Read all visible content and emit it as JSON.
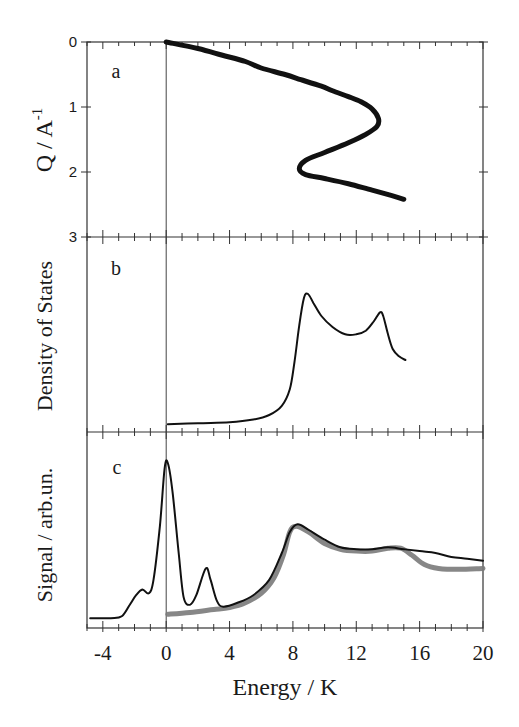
{
  "chart_data": [
    {
      "panel": "a",
      "type": "line",
      "panel_label": "a",
      "xlabel": "Energy / K",
      "ylabel": "Q / A^-1",
      "ylabel_main": "Q / A",
      "ylabel_sup": "-1",
      "xlim": [
        -5,
        20
      ],
      "ylim": [
        3,
        0
      ],
      "y_inverted": true,
      "yticks": [
        "0",
        "1",
        "2",
        "3"
      ],
      "grid": false,
      "series": [
        {
          "name": "dispersion",
          "color": "#111111",
          "points": [
            [
              0,
              0
            ],
            [
              2,
              0.1
            ],
            [
              3.5,
              0.2
            ],
            [
              5,
              0.3
            ],
            [
              6,
              0.4
            ],
            [
              7.5,
              0.5
            ],
            [
              8.5,
              0.58
            ],
            [
              9.8,
              0.68
            ],
            [
              10.5,
              0.75
            ],
            [
              11.5,
              0.84
            ],
            [
              12.3,
              0.92
            ],
            [
              13,
              1.03
            ],
            [
              13.4,
              1.18
            ],
            [
              13.3,
              1.3
            ],
            [
              12.6,
              1.42
            ],
            [
              11.5,
              1.55
            ],
            [
              10,
              1.7
            ],
            [
              8.8,
              1.82
            ],
            [
              8.4,
              1.95
            ],
            [
              8.8,
              2.04
            ],
            [
              10,
              2.1
            ],
            [
              11.5,
              2.18
            ],
            [
              13,
              2.28
            ],
            [
              14.2,
              2.36
            ],
            [
              15,
              2.42
            ]
          ]
        }
      ]
    },
    {
      "panel": "b",
      "type": "line",
      "panel_label": "b",
      "xlabel": "Energy / K",
      "ylabel": "Density of States",
      "xlim": [
        -5,
        20
      ],
      "ylim": [
        0,
        1
      ],
      "grid": false,
      "series": [
        {
          "name": "density of states",
          "color": "#111111",
          "points": [
            [
              0.1,
              0.01
            ],
            [
              2,
              0.015
            ],
            [
              4,
              0.02
            ],
            [
              5.5,
              0.035
            ],
            [
              6.5,
              0.06
            ],
            [
              7.3,
              0.11
            ],
            [
              7.8,
              0.2
            ],
            [
              8.1,
              0.35
            ],
            [
              8.4,
              0.55
            ],
            [
              8.7,
              0.7
            ],
            [
              8.95,
              0.72
            ],
            [
              9.3,
              0.67
            ],
            [
              9.8,
              0.6
            ],
            [
              10.5,
              0.54
            ],
            [
              11.3,
              0.5
            ],
            [
              12,
              0.5
            ],
            [
              12.6,
              0.52
            ],
            [
              13.1,
              0.57
            ],
            [
              13.5,
              0.62
            ],
            [
              13.7,
              0.6
            ],
            [
              14,
              0.5
            ],
            [
              14.3,
              0.42
            ],
            [
              14.7,
              0.38
            ],
            [
              15.1,
              0.36
            ]
          ]
        }
      ]
    },
    {
      "panel": "c",
      "type": "line",
      "panel_label": "c",
      "xlabel": "Energy / K",
      "ylabel": "Signal / arb.un.",
      "xlim": [
        -5,
        20
      ],
      "ylim": [
        0,
        1
      ],
      "xticks": [
        "-4",
        "0",
        "4",
        "8",
        "12",
        "16",
        "20"
      ],
      "grid": false,
      "series": [
        {
          "name": "measured signal",
          "color": "#111111",
          "points": [
            [
              -4.8,
              0.02
            ],
            [
              -3.5,
              0.02
            ],
            [
              -2.8,
              0.03
            ],
            [
              -2.3,
              0.09
            ],
            [
              -1.9,
              0.14
            ],
            [
              -1.5,
              0.17
            ],
            [
              -1.1,
              0.15
            ],
            [
              -0.8,
              0.22
            ],
            [
              -0.4,
              0.5
            ],
            [
              -0.1,
              0.8
            ],
            [
              0.1,
              0.83
            ],
            [
              0.4,
              0.68
            ],
            [
              0.8,
              0.35
            ],
            [
              1.1,
              0.13
            ],
            [
              1.5,
              0.09
            ],
            [
              1.9,
              0.14
            ],
            [
              2.5,
              0.28
            ],
            [
              2.8,
              0.22
            ],
            [
              3.2,
              0.11
            ],
            [
              3.6,
              0.08
            ],
            [
              4.5,
              0.1
            ],
            [
              5.5,
              0.14
            ],
            [
              6.5,
              0.22
            ],
            [
              7.3,
              0.36
            ],
            [
              7.8,
              0.47
            ],
            [
              8.3,
              0.51
            ],
            [
              9,
              0.48
            ],
            [
              10,
              0.43
            ],
            [
              11,
              0.39
            ],
            [
              12,
              0.38
            ],
            [
              13,
              0.38
            ],
            [
              14,
              0.39
            ],
            [
              15,
              0.38
            ],
            [
              16,
              0.37
            ],
            [
              17,
              0.36
            ],
            [
              18,
              0.34
            ],
            [
              19,
              0.33
            ],
            [
              20,
              0.32
            ]
          ]
        },
        {
          "name": "calculated",
          "color": "#7a7a7a",
          "points": [
            [
              0.1,
              0.04
            ],
            [
              1.5,
              0.05
            ],
            [
              3,
              0.065
            ],
            [
              4,
              0.075
            ],
            [
              5,
              0.1
            ],
            [
              6,
              0.15
            ],
            [
              6.8,
              0.23
            ],
            [
              7.4,
              0.35
            ],
            [
              7.8,
              0.47
            ],
            [
              8.2,
              0.5
            ],
            [
              9,
              0.47
            ],
            [
              10,
              0.41
            ],
            [
              11,
              0.38
            ],
            [
              12,
              0.37
            ],
            [
              13,
              0.37
            ],
            [
              14,
              0.385
            ],
            [
              14.8,
              0.385
            ],
            [
              15.5,
              0.35
            ],
            [
              16.3,
              0.3
            ],
            [
              17.2,
              0.28
            ],
            [
              18.5,
              0.275
            ],
            [
              20,
              0.28
            ]
          ]
        }
      ]
    }
  ],
  "figure": {
    "panel_labels": [
      "a",
      "b",
      "c"
    ],
    "x_axis_title": "Energy / K",
    "x_tick_labels": [
      "-4",
      "0",
      "4",
      "8",
      "12",
      "16",
      "20"
    ],
    "panel_a_y_ticks": [
      "0",
      "1",
      "2",
      "3"
    ],
    "panel_a_ylabel_main": "Q / A",
    "panel_a_ylabel_sup": "-1",
    "panel_b_ylabel": "Density of States",
    "panel_c_ylabel": "Signal / arb.un."
  }
}
